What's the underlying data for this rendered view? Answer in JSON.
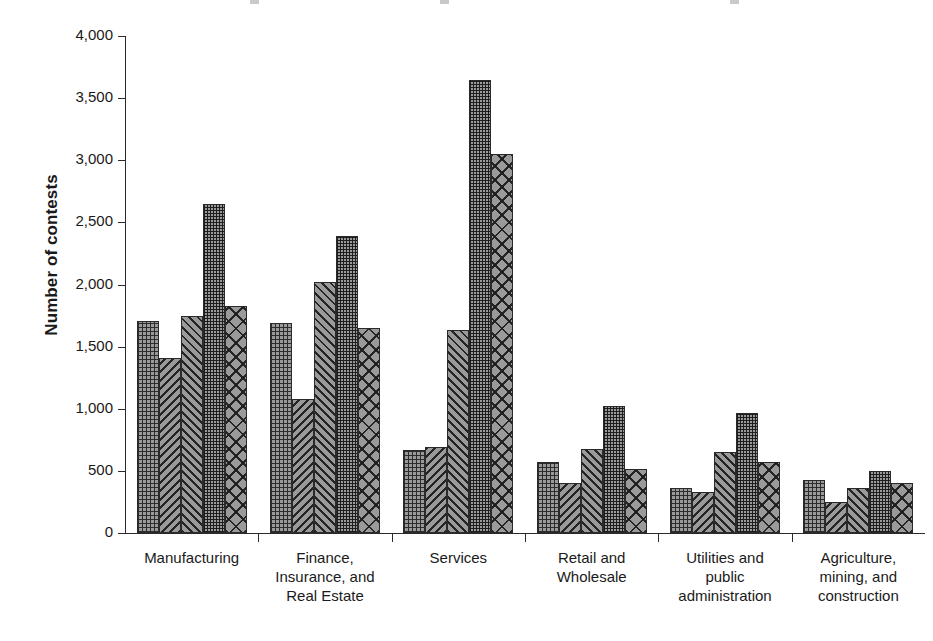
{
  "chart_data": {
    "type": "bar",
    "title": "",
    "subtitle": "",
    "xlabel": "",
    "ylabel": "Number of contests",
    "ylim": [
      0,
      4000
    ],
    "ytick_labels": [
      "4,000",
      "3,500",
      "3,000",
      "2,500",
      "2,000",
      "1,500",
      "1,000",
      "500",
      "0"
    ],
    "ytick_values": [
      4000,
      3500,
      3000,
      2500,
      2000,
      1500,
      1000,
      500,
      0
    ],
    "grid": false,
    "legend": "none",
    "categories": [
      "Manufacturing",
      "Finance, Insurance, and Real Estate",
      "Services",
      "Retail and Wholesale",
      "Utilities and public administration",
      "Agriculture, mining, and construction"
    ],
    "category_lines": [
      [
        "Manufacturing"
      ],
      [
        "Finance,",
        "Insurance, and",
        "Real Estate"
      ],
      [
        "Services"
      ],
      [
        "Retail and",
        "Wholesale"
      ],
      [
        "Utilities and",
        "public",
        "administration"
      ],
      [
        "Agriculture,",
        "mining, and",
        "construction"
      ]
    ],
    "series": [
      {
        "name": "Series 1",
        "pattern": "fine-crosshatch",
        "values": [
          1710,
          1690,
          670,
          575,
          365,
          430
        ]
      },
      {
        "name": "Series 2",
        "pattern": "diagonal-backslash",
        "values": [
          1410,
          1080,
          690,
          400,
          330,
          250
        ]
      },
      {
        "name": "Series 3",
        "pattern": "diagonal-slash",
        "values": [
          1750,
          2020,
          1630,
          680,
          655,
          365
        ]
      },
      {
        "name": "Series 4",
        "pattern": "dense-grid",
        "values": [
          2650,
          2390,
          3650,
          1020,
          965,
          500
        ]
      },
      {
        "name": "Series 5",
        "pattern": "large-cross-diagonal",
        "values": [
          1830,
          1650,
          3050,
          515,
          575,
          405
        ]
      }
    ],
    "colors": {
      "bar_fill": "#9a9a9a",
      "bar_outline": "#2a2a2a",
      "axis": "#2b2b2b",
      "text": "#1a1a1a",
      "background": "#ffffff"
    }
  }
}
